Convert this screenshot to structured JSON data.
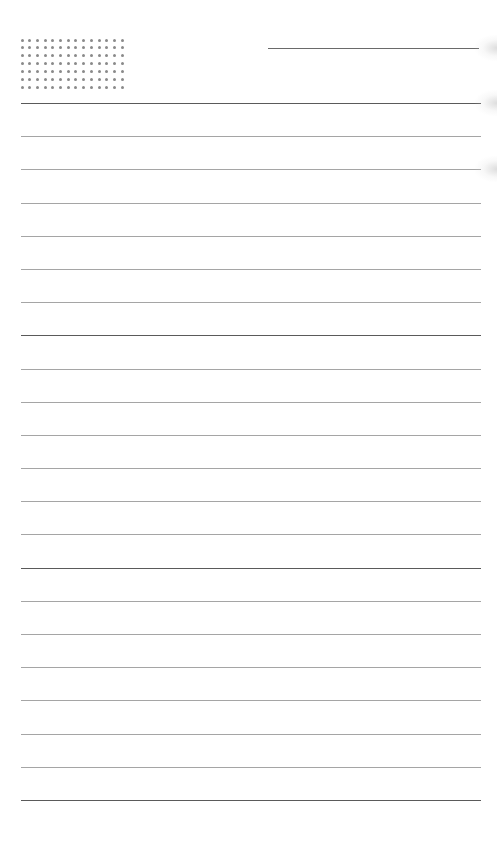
{
  "page": {
    "type": "lined-notebook-page",
    "background": "#ffffff"
  },
  "dot_grid": {
    "columns": 14,
    "rows": 7,
    "origin_x": 22,
    "origin_y": 40,
    "spacing_x": 7.7,
    "spacing_y": 7.9,
    "color": "#8a8a8a"
  },
  "header_line": {
    "x1": 268,
    "x2": 479,
    "y": 48,
    "color": "#6a6a6a"
  },
  "ruled_lines": {
    "count": 22,
    "first_y": 103,
    "spacing": 33.19,
    "x1": 21,
    "x2": 481,
    "major_every": 7,
    "major_color": "#5a5a5a",
    "minor_color": "#a5a5a5"
  },
  "edge_shadows": [
    {
      "y": 48
    },
    {
      "y": 103
    },
    {
      "y": 169
    }
  ]
}
